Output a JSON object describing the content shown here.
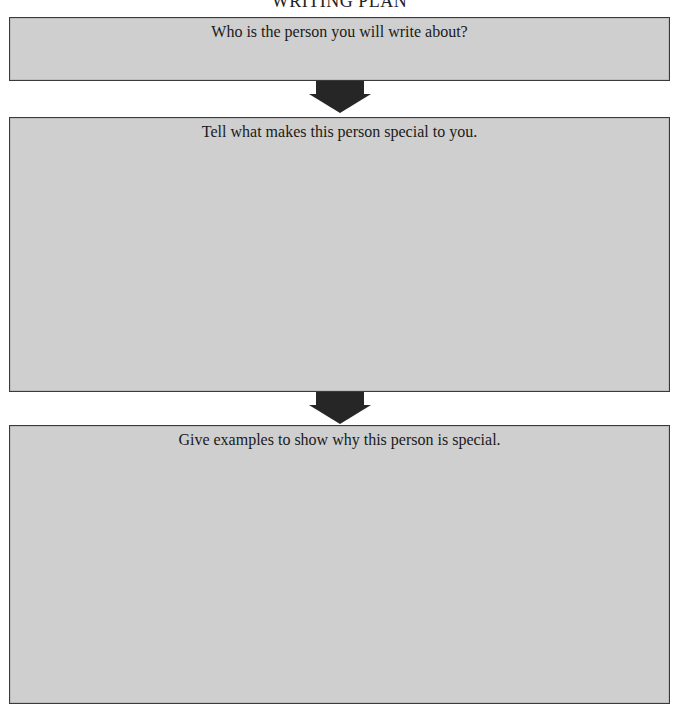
{
  "page": {
    "title": "WRITING PLAN"
  },
  "boxes": [
    {
      "prompt": "Who is the person you will write about?",
      "value": ""
    },
    {
      "prompt": "Tell what makes this person special to you.",
      "value": ""
    },
    {
      "prompt": "Give examples to show why this person is special.",
      "value": ""
    }
  ],
  "icons": {
    "arrow": "down-arrow-icon"
  },
  "colors": {
    "box_fill": "#cfcfcf",
    "box_border": "#3a3a3a",
    "arrow": "#262626",
    "background": "#ffffff"
  }
}
